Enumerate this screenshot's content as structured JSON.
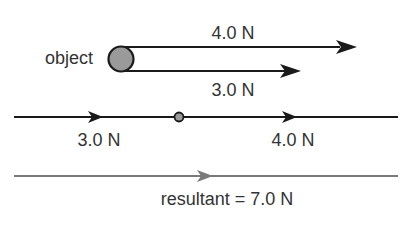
{
  "diagram": {
    "object_label": "object",
    "top_forces": [
      {
        "label": "4.0 N",
        "magnitude": 4.0,
        "unit": "N"
      },
      {
        "label": "3.0 N",
        "magnitude": 3.0,
        "unit": "N"
      }
    ],
    "combined_line": {
      "left_label": "3.0 N",
      "right_label": "4.0 N"
    },
    "resultant": {
      "label": "resultant = 7.0 N",
      "magnitude": 7.0,
      "unit": "N"
    },
    "colors": {
      "line": "#1a1a1a",
      "object_fill": "#9a9a9a",
      "resultant_line": "#7a7a7a",
      "text": "#333333"
    }
  }
}
